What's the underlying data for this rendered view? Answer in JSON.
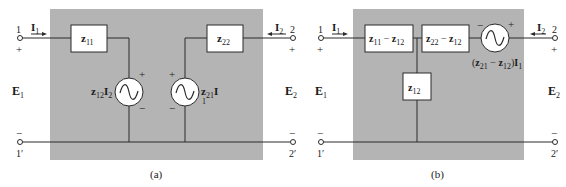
{
  "colors": {
    "panel": "#b4b4b4",
    "wire": "#2a2a2a",
    "box_fill": "#ffffff",
    "text": "#1a1a1a",
    "background": "#ffffff"
  },
  "diagram_a": {
    "caption": "(a)",
    "port1": {
      "terminal_top": "1",
      "terminal_bottom": "1′",
      "plus": "+",
      "minus": "−",
      "voltage": "E",
      "voltage_sub": "1",
      "current": "I",
      "current_sub": "1"
    },
    "port2": {
      "terminal_top": "2",
      "terminal_bottom": "2′",
      "plus": "+",
      "minus": "−",
      "voltage": "E",
      "voltage_sub": "2",
      "current": "I",
      "current_sub": "2"
    },
    "z11": {
      "main": "z",
      "sub": "11"
    },
    "z22": {
      "main": "z",
      "sub": "22"
    },
    "source_left": {
      "coef": "z",
      "coef_sub": "12",
      "var": "I",
      "var_sub": "2",
      "plus": "+",
      "minus": "−"
    },
    "source_right": {
      "coef": "z",
      "coef_sub": "21",
      "var": "I",
      "var_sub": "1",
      "plus": "+",
      "minus": "−"
    }
  },
  "diagram_b": {
    "caption": "(b)",
    "port1": {
      "terminal_top": "1",
      "terminal_bottom": "1′",
      "plus": "+",
      "minus": "−",
      "voltage": "E",
      "voltage_sub": "1",
      "current": "I",
      "current_sub": "1"
    },
    "port2": {
      "terminal_top": "2",
      "terminal_bottom": "2′",
      "plus": "+",
      "minus": "−",
      "voltage": "E",
      "voltage_sub": "2",
      "current": "I",
      "current_sub": "2"
    },
    "series_left": {
      "a": "z",
      "a_sub": "11",
      "op": " − ",
      "b": "z",
      "b_sub": "12"
    },
    "series_right": {
      "a": "z",
      "a_sub": "22",
      "op": " − ",
      "b": "z",
      "b_sub": "12"
    },
    "shunt": {
      "main": "z",
      "sub": "12"
    },
    "source": {
      "open": "(",
      "a": "z",
      "a_sub": "21",
      "op": " − ",
      "b": "z",
      "b_sub": "12",
      "close": ")",
      "var": "I",
      "var_sub": "1",
      "plus": "+",
      "minus": "−"
    }
  }
}
